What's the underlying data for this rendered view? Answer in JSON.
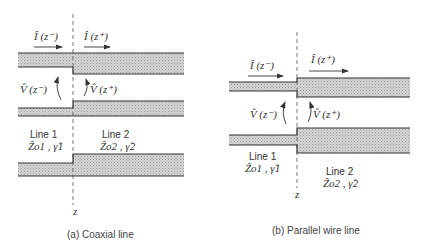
{
  "figure_a": {
    "caption": "(a) Coaxial line",
    "current_left": "Î (z⁻)",
    "current_right": "Î (z⁺)",
    "voltage_left": "V̂ (z⁻)",
    "voltage_right": "V̂ (z⁺)",
    "line1_title": "Line 1",
    "line1_params": "Ẑo1 , γ̂1",
    "line2_title": "Line 2",
    "line2_params": "Ẑo2 , γ̂2",
    "axis_label": "z"
  },
  "figure_b": {
    "caption": "(b) Parallel wire line",
    "current_left": "Î (z⁻)",
    "current_right": "Î (z⁺)",
    "voltage_left": "V̂ (z⁻)",
    "voltage_right": "V̂ (z⁺)",
    "line1_title": "Line 1",
    "line1_params": "Ẑo1 , γ̂1",
    "line2_title": "Line 2",
    "line2_params": "Ẑo2 , γ̂2",
    "axis_label": "z"
  },
  "colors": {
    "conductor_fill": "#c8c8c8",
    "outline": "#333333"
  }
}
